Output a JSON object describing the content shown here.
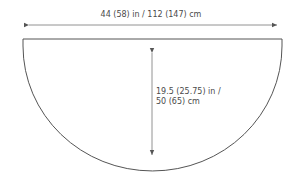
{
  "diagram": {
    "shape": "half-circle",
    "width_label": "44 (58) in / 112 (147) cm",
    "depth_label_line1": "19.5 (25.75) in /",
    "depth_label_line2": "50 (65) cm",
    "colors": {
      "stroke": "#555555",
      "text": "#4a4a4a",
      "background": "#ffffff"
    }
  }
}
